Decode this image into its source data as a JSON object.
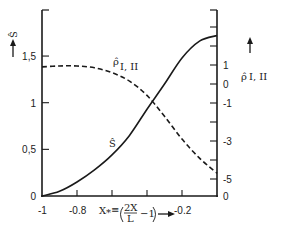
{
  "chart_data": {
    "type": "line",
    "title": "",
    "xlabel": "X* ≡ (2X/L − 1) →",
    "ylabel_left": "Ŝ ↑",
    "ylabel_right": "ρ̂ I, II ↑",
    "xlim": [
      -1,
      0
    ],
    "ylim_left": [
      0,
      2.0
    ],
    "ylim_right": [
      -5.9,
      3.9
    ],
    "x_ticks": [
      -1,
      -0.8,
      -0.6,
      -0.4,
      -0.2,
      0
    ],
    "x_tick_labels": [
      "-1",
      "-0.8",
      "",
      "",
      "-0.2",
      ""
    ],
    "y_left_ticks": [
      0,
      0.5,
      1,
      1.5
    ],
    "y_left_tick_labels": [
      "0",
      "0,5",
      "1",
      "1,5"
    ],
    "y_right_ticks": [
      -6,
      -5,
      -4,
      -3,
      -2,
      -1,
      0,
      1,
      2
    ],
    "y_right_tick_labels": [
      "0",
      "-5",
      "",
      "-3",
      "",
      "-1",
      "0",
      "1",
      ""
    ],
    "grid": false,
    "legend": "none",
    "annotations": [
      {
        "text": "ρ̂ I, II",
        "near": "dashed curve",
        "x": -0.6,
        "y_left": 1.32
      },
      {
        "text": "Ŝ",
        "near": "solid curve",
        "x": -0.6,
        "y_left": 0.53
      }
    ],
    "series": [
      {
        "name": "Ŝ",
        "axis": "left",
        "style": "solid",
        "x": [
          -1.0,
          -0.9,
          -0.8,
          -0.7,
          -0.6,
          -0.5,
          -0.4,
          -0.3,
          -0.2,
          -0.1,
          0.0
        ],
        "values": [
          0.0,
          0.05,
          0.15,
          0.28,
          0.44,
          0.65,
          0.93,
          1.2,
          1.48,
          1.66,
          1.72
        ]
      },
      {
        "name": "ρ̂ I, II",
        "axis": "right",
        "style": "dashed",
        "x": [
          -1.0,
          -0.9,
          -0.8,
          -0.7,
          -0.6,
          -0.5,
          -0.4,
          -0.3,
          -0.2,
          -0.1,
          0.0
        ],
        "values": [
          0.9,
          0.95,
          0.95,
          0.85,
          0.6,
          0.15,
          -0.6,
          -1.7,
          -2.9,
          -3.9,
          -4.7
        ]
      }
    ]
  }
}
